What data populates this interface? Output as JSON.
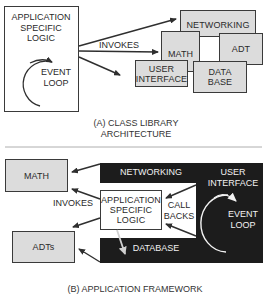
{
  "diagram_a": {
    "app_box": {
      "line1": "APPLICATION",
      "line2": "SPECIFIC",
      "line3": "LOGIC"
    },
    "event_loop": {
      "line1": "EVENT",
      "line2": "LOOP"
    },
    "invokes_label": "INVOKES",
    "libraries": {
      "networking": "NETWORKING",
      "math": "MATH",
      "adt": "ADT",
      "user_interface": {
        "line1": "USER",
        "line2": "INTERFACE"
      },
      "database": {
        "line1": "DATA",
        "line2": "BASE"
      }
    },
    "caption": {
      "line1": "(A) CLASS LIBRARY",
      "line2": "ARCHITECTURE"
    }
  },
  "diagram_b": {
    "math": "MATH",
    "adts": "ADTs",
    "invokes_label": "INVOKES",
    "networking": "NETWORKING",
    "database": "DATABASE",
    "user_interface": {
      "line1": "USER",
      "line2": "INTERFACE"
    },
    "app_box": {
      "line1": "APPLICATION",
      "line2": "SPECIFIC",
      "line3": "LOGIC"
    },
    "callbacks": {
      "line1": "CALL",
      "line2": "BACKS"
    },
    "event_loop": {
      "line1": "EVENT",
      "line2": "LOOP"
    },
    "caption": "(B) APPLICATION FRAMEWORK"
  },
  "colors": {
    "box_fill": "#dcdcdc",
    "border": "#3a3a3a",
    "dark_fill": "#1c1c1c"
  }
}
